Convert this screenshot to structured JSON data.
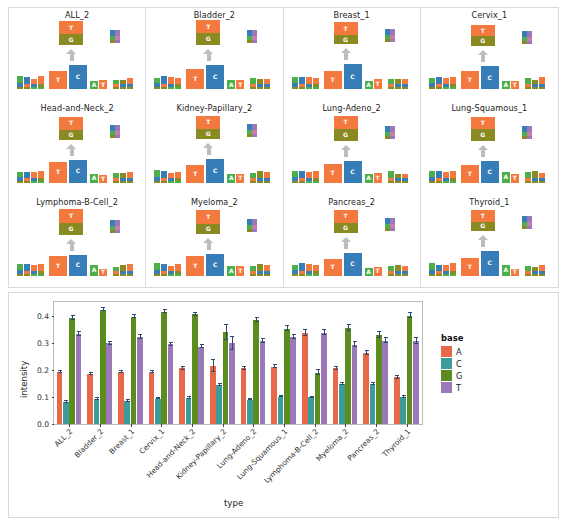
{
  "figure": {
    "logo_panel_name": "sequence-logo-grid",
    "chart_panel_name": "base-intensity-barchart"
  },
  "logo_panels": [
    {
      "title": "ALL_2"
    },
    {
      "title": "Bladder_2"
    },
    {
      "title": "Breast_1"
    },
    {
      "title": "Cervix_1"
    },
    {
      "title": "Head-and-Neck_2"
    },
    {
      "title": "Kidney-Papillary_2"
    },
    {
      "title": "Lung-Adeno_2"
    },
    {
      "title": "Lung-Squamous_1"
    },
    {
      "title": "Lymphoma-B-Cell_2"
    },
    {
      "title": "Myeloma_2"
    },
    {
      "title": "Pancreas_2"
    },
    {
      "title": "Thyroid_1"
    }
  ],
  "logo_glyphs": {
    "top_stack": [
      {
        "base": "T",
        "share": 0.52
      },
      {
        "base": "G",
        "share": 0.48
      }
    ],
    "main_letters": [
      {
        "base": "T",
        "label": "T"
      },
      {
        "base": "C",
        "label": "C"
      },
      {
        "base": "A",
        "label": "A"
      },
      {
        "base": "T",
        "label": "T"
      }
    ],
    "arrow": "up-arrow-icon"
  },
  "base_colors": {
    "A": "#4DAF4A",
    "C": "#377EB8",
    "G": "#8A8A23",
    "T": "#F4793F"
  },
  "chart_data": {
    "type": "bar",
    "title": "",
    "xlabel": "type",
    "ylabel": "intensity",
    "ylim": [
      0.0,
      0.45
    ],
    "yticks": [
      "0.0",
      "0.1",
      "0.2",
      "0.3",
      "0.4"
    ],
    "ytick_values": [
      0.0,
      0.1,
      0.2,
      0.3,
      0.4
    ],
    "grid": false,
    "legend_title": "base",
    "legend_position": "right",
    "categories": [
      "ALL_2",
      "Bladder_2",
      "Breast_1",
      "Cervix_1",
      "Head-and-Neck_2",
      "Kidney-Papillary_2",
      "Lung-Adeno_2",
      "Lung-Squamous_1",
      "Lymphoma-B-Cell_2",
      "Myeloma_2",
      "Pancreas_2",
      "Thyroid_1"
    ],
    "series": [
      {
        "name": "A",
        "color": "#E8684A",
        "values": [
          0.192,
          0.183,
          0.191,
          0.192,
          0.205,
          0.213,
          0.205,
          0.212,
          0.335,
          0.205,
          0.262,
          0.172
        ],
        "errors": [
          0.004,
          0.004,
          0.004,
          0.004,
          0.005,
          0.022,
          0.005,
          0.005,
          0.01,
          0.007,
          0.008,
          0.006
        ]
      },
      {
        "name": "C",
        "color": "#3C9B9B",
        "values": [
          0.082,
          0.093,
          0.085,
          0.094,
          0.097,
          0.143,
          0.09,
          0.101,
          0.098,
          0.147,
          0.147,
          0.1
        ]
      },
      {
        "name": "G",
        "color": "#5C8B1E",
        "values": [
          0.392,
          0.422,
          0.396,
          0.415,
          0.404,
          0.338,
          0.385,
          0.352,
          0.19,
          0.355,
          0.33,
          0.4
        ],
        "errors": [
          0.007,
          0.006,
          0.006,
          0.007,
          0.006,
          0.028,
          0.007,
          0.008,
          0.008,
          0.012,
          0.011,
          0.01
        ]
      },
      {
        "name": "T",
        "color": "#9B78B8",
        "values": [
          0.332,
          0.297,
          0.321,
          0.294,
          0.285,
          0.297,
          0.306,
          0.32,
          0.337,
          0.292,
          0.307,
          0.306
        ],
        "errors": [
          0.008,
          0.005,
          0.006,
          0.006,
          0.005,
          0.024,
          0.006,
          0.007,
          0.01,
          0.009,
          0.009,
          0.01
        ]
      }
    ]
  }
}
